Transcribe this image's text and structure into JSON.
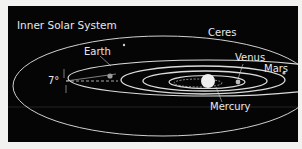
{
  "title": "Inner Solar System",
  "labels": {
    "ceres": "Ceres",
    "earth": "Earth",
    "venus": "Venus",
    "mars": "Mars",
    "mercury": "Mercury",
    "inclination": "7°"
  },
  "colors": {
    "background": "#050505",
    "orbit": "#d8d8d8",
    "text": "#e8e8e8",
    "page": "#f2f2f0"
  }
}
